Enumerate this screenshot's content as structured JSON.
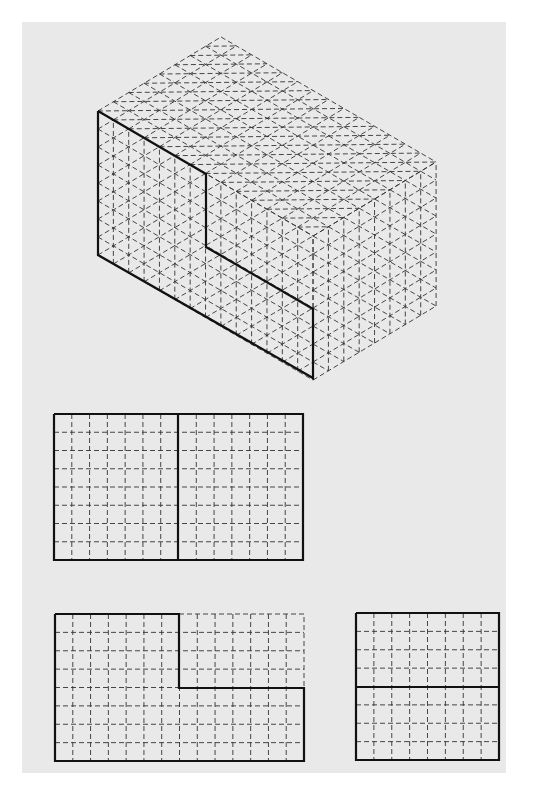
{
  "page": {
    "width": 551,
    "height": 789,
    "background": "#ffffff",
    "paper": {
      "x": 22,
      "y": 22,
      "width": 484,
      "height": 751,
      "color": "#e9e9e9"
    }
  },
  "colors": {
    "outline": "#111111",
    "grid": "#333333"
  },
  "isometric_view": {
    "description": "Isometric grid box 14 x 8 x 8 units with bold L-shaped outline on front face",
    "units": {
      "length": 14,
      "depth": 8,
      "height": 8
    },
    "origin_left_top": [
      98,
      111
    ],
    "step_long": [
      15.36,
      8.93
    ],
    "step_depth": [
      15.38,
      -9.25
    ],
    "step_up": [
      0,
      -18.0
    ],
    "bold_outline": [
      [
        98,
        111
      ],
      [
        206,
        174
      ],
      [
        206,
        247
      ],
      [
        313,
        309
      ],
      [
        313,
        378
      ],
      [
        98,
        255
      ],
      [
        98,
        111
      ]
    ]
  },
  "orthographic_views": [
    {
      "name": "top-view",
      "x": 54,
      "y": 414,
      "width": 249,
      "height": 146,
      "cols": 14,
      "rows": 8,
      "bold_outline": [
        [
          54,
          414
        ],
        [
          303,
          414
        ],
        [
          303,
          560
        ],
        [
          54,
          560
        ],
        [
          54,
          414
        ]
      ],
      "bold_lines": [
        [
          [
            178,
            414
          ],
          [
            178,
            560
          ]
        ]
      ]
    },
    {
      "name": "front-view",
      "x": 55,
      "y": 614,
      "width": 249,
      "height": 147,
      "cols": 14,
      "rows": 8,
      "bold_outline": [
        [
          55,
          614
        ],
        [
          179,
          614
        ],
        [
          179,
          688
        ],
        [
          304,
          688
        ],
        [
          304,
          761
        ],
        [
          55,
          761
        ],
        [
          55,
          614
        ]
      ],
      "dashed_outline": [
        [
          179,
          614
        ],
        [
          304,
          614
        ],
        [
          304,
          688
        ]
      ],
      "bold_lines": []
    },
    {
      "name": "side-view",
      "x": 356,
      "y": 613,
      "width": 143,
      "height": 147,
      "cols": 8,
      "rows": 8,
      "bold_outline": [
        [
          356,
          613
        ],
        [
          499,
          613
        ],
        [
          499,
          760
        ],
        [
          356,
          760
        ],
        [
          356,
          613
        ]
      ],
      "bold_lines": [
        [
          [
            356,
            687
          ],
          [
            499,
            687
          ]
        ]
      ]
    }
  ]
}
